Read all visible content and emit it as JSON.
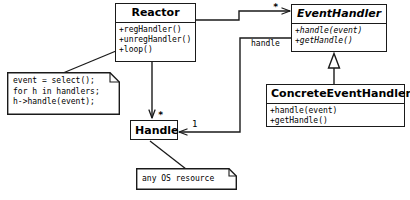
{
  "diagram": {
    "stroke_color": "#1a1a1a",
    "background_color": "#ffffff",
    "text_color": "#000000"
  },
  "classes": {
    "reactor": {
      "name": "Reactor",
      "abstract": false,
      "methods": [
        "+regHandler()",
        "+unregHandler()",
        "+loop()"
      ]
    },
    "event_handler": {
      "name": "EventHandler",
      "abstract": true,
      "methods": [
        "+handle(event)",
        "+getHandle()"
      ]
    },
    "concrete_event_handler": {
      "name": "ConcreteEventHandler",
      "abstract": false,
      "methods": [
        "+handle(event)",
        "+getHandle()"
      ]
    },
    "handle": {
      "name": "Handle",
      "abstract": false,
      "methods": []
    }
  },
  "notes": {
    "reactor_loop": {
      "lines": [
        "event = select();",
        "for h in handlers;",
        "h->handle(event);"
      ]
    },
    "handle_resource": {
      "lines": [
        "any OS resource"
      ]
    }
  },
  "edges": {
    "reactor_to_event_handler": {
      "label": "",
      "multiplicity_target": "*",
      "type": "association"
    },
    "reactor_to_handle": {
      "label": "",
      "multiplicity_target": "*",
      "type": "association"
    },
    "event_handler_to_handle": {
      "label": "handle",
      "multiplicity_target": "1",
      "type": "association"
    },
    "concrete_to_event_handler": {
      "label": "",
      "multiplicity_target": "",
      "type": "generalization"
    }
  }
}
